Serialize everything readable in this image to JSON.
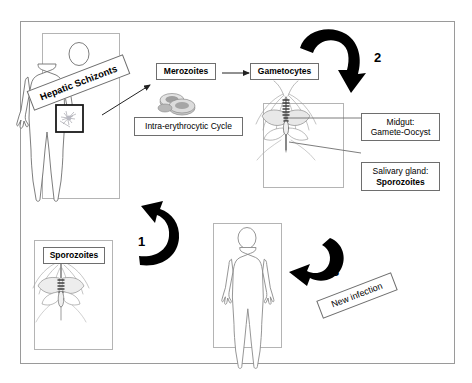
{
  "diagram": {
    "labels": {
      "hepatic_schizonts": "Hepatic Schizonts",
      "merozoites": "Merozoites",
      "gametocytes": "Gametocytes",
      "intra_erythrocytic_cycle": "Intra-erythrocytic Cycle",
      "midgut_line1": "Midgut:",
      "midgut_line2": "Gamete-Oocyst",
      "salivary_line1": "Salivary gland:",
      "salivary_line2": "Sporozoites",
      "sporozoites": "Sporozoites",
      "new_infection": "New infection"
    },
    "step_numbers": {
      "one": "1",
      "two": "2",
      "three": "3"
    },
    "colors": {
      "arrow": "#000000",
      "frame_border": "#9a9a9a",
      "panel_border": "#b4b4b4",
      "label_border": "#6e6e6e",
      "figure_outline": "#6f6f6f",
      "liver_box_border": "#1a1a1a",
      "background": "#ffffff"
    }
  }
}
